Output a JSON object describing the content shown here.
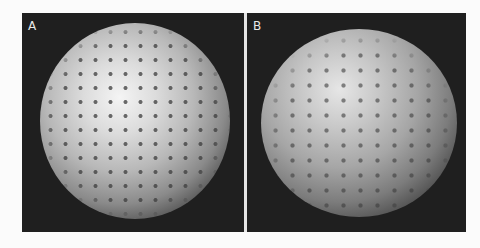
{
  "figure": {
    "panels": [
      {
        "label": "A",
        "description": "bright sphere with regular dot lattice"
      },
      {
        "label": "B",
        "description": "sphere with dot lattice, textured surface"
      }
    ],
    "colors": {
      "background": "#1f1f1f",
      "divider": "#e6e6e6",
      "label": "#e8e8e8"
    }
  }
}
